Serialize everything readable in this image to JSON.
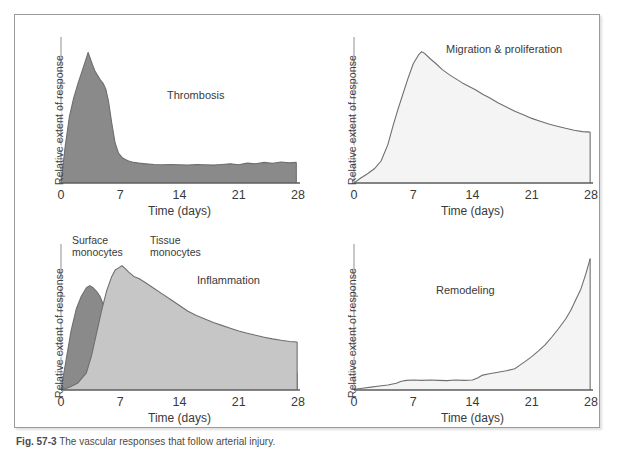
{
  "figure": {
    "caption_number": "Fig. 57-3",
    "caption_text": "The vascular responses that follow arterial injury.",
    "frame_color": "#9a9a9a",
    "background": "#ffffff"
  },
  "colors": {
    "dark_fill": "#8a8a8a",
    "mid_fill": "#c6c6c6",
    "light_fill": "#f4f4f4",
    "stroke": "#6f6f6f",
    "axis": "#9a9a9a",
    "text": "#3a3a3a"
  },
  "axes": {
    "xlabel": "Time (days)",
    "ylabel": "Relative extent of response",
    "xticks": [
      "0",
      "7",
      "14",
      "21",
      "28"
    ],
    "xlim": [
      0,
      28
    ],
    "ylim": [
      0,
      1
    ]
  },
  "chart_data": [
    {
      "type": "area",
      "title": "Thrombosis",
      "panel": "top-left",
      "xlabel": "Time (days)",
      "ylabel": "Relative extent of response",
      "xticks": [
        0,
        7,
        14,
        21,
        28
      ],
      "xlim": [
        0,
        28
      ],
      "ylim": [
        0,
        1
      ],
      "grid": false,
      "legend": "none",
      "series": [
        {
          "name": "Thrombosis",
          "fill": "#8a8a8a",
          "x": [
            0,
            0.5,
            1,
            1.5,
            2,
            2.5,
            3,
            3.2,
            3.5,
            3.8,
            4,
            4.3,
            4.6,
            5,
            5.3,
            5.6,
            6,
            6.4,
            6.8,
            7.2,
            7.6,
            8,
            8.6,
            9.2,
            10,
            11,
            12,
            13,
            14,
            15,
            16,
            17,
            18,
            19,
            20,
            21,
            22,
            23,
            24,
            25,
            26,
            27,
            27.8
          ],
          "values": [
            0.0,
            0.26,
            0.47,
            0.6,
            0.7,
            0.79,
            0.88,
            0.92,
            0.87,
            0.82,
            0.79,
            0.76,
            0.73,
            0.7,
            0.66,
            0.58,
            0.42,
            0.28,
            0.21,
            0.18,
            0.165,
            0.155,
            0.145,
            0.14,
            0.135,
            0.13,
            0.128,
            0.13,
            0.128,
            0.127,
            0.13,
            0.128,
            0.126,
            0.13,
            0.135,
            0.128,
            0.14,
            0.135,
            0.145,
            0.138,
            0.148,
            0.142,
            0.145
          ]
        }
      ]
    },
    {
      "type": "area",
      "title": "Migration & proliferation",
      "panel": "top-right",
      "xlabel": "Time (days)",
      "ylabel": "Relative extent of response",
      "xticks": [
        0,
        7,
        14,
        21,
        28
      ],
      "xlim": [
        0,
        28
      ],
      "ylim": [
        0,
        1
      ],
      "grid": false,
      "legend": "none",
      "series": [
        {
          "name": "Migration & proliferation",
          "fill": "#f4f4f4",
          "x": [
            0,
            0.8,
            1.6,
            2.4,
            3.2,
            4,
            4.6,
            5.2,
            5.8,
            6.4,
            7,
            7.6,
            8,
            8.4,
            9,
            9.6,
            10.4,
            11.2,
            12,
            12.8,
            13.6,
            14.4,
            15.2,
            16,
            17,
            18,
            19,
            20,
            21,
            22,
            23,
            24,
            25,
            26,
            27,
            27.9
          ],
          "values": [
            0.0,
            0.035,
            0.065,
            0.1,
            0.155,
            0.27,
            0.4,
            0.52,
            0.63,
            0.74,
            0.84,
            0.9,
            0.925,
            0.91,
            0.875,
            0.845,
            0.8,
            0.765,
            0.735,
            0.705,
            0.68,
            0.655,
            0.625,
            0.6,
            0.565,
            0.535,
            0.505,
            0.48,
            0.455,
            0.435,
            0.415,
            0.4,
            0.385,
            0.372,
            0.362,
            0.358
          ]
        }
      ]
    },
    {
      "type": "area",
      "title": "Inflammation",
      "panel": "bottom-left",
      "xlabel": "Time (days)",
      "ylabel": "Relative extent of response",
      "xticks": [
        0,
        7,
        14,
        21,
        28
      ],
      "xlim": [
        0,
        28
      ],
      "ylim": [
        0,
        1
      ],
      "grid": false,
      "legend": "inline-annotations",
      "series": [
        {
          "name": "Surface monocytes",
          "fill": "#8a8a8a",
          "x": [
            0,
            0.6,
            1.2,
            1.8,
            2.4,
            3,
            3.4,
            3.8,
            4.2,
            4.6,
            5,
            5.4,
            5.8,
            6.2,
            6.6,
            7,
            7.6,
            8.2,
            9,
            10,
            11,
            12,
            13,
            14,
            16,
            18,
            20,
            22,
            24,
            26,
            27.9
          ],
          "values": [
            0.0,
            0.21,
            0.42,
            0.57,
            0.66,
            0.72,
            0.735,
            0.72,
            0.695,
            0.66,
            0.6,
            0.5,
            0.38,
            0.27,
            0.2,
            0.165,
            0.145,
            0.135,
            0.128,
            0.125,
            0.124,
            0.123,
            0.123,
            0.122,
            0.122,
            0.122,
            0.122,
            0.122,
            0.122,
            0.122,
            0.122
          ]
        },
        {
          "name": "Tissue monocytes",
          "fill": "#c6c6c6",
          "x": [
            0,
            1,
            2,
            3,
            3.6,
            4.2,
            4.8,
            5.4,
            6,
            6.4,
            6.8,
            7.2,
            7.6,
            8,
            8.6,
            9.2,
            10,
            11,
            12,
            13,
            14,
            15,
            16,
            17,
            18,
            19,
            20,
            21,
            22,
            23,
            24,
            25,
            26,
            27,
            27.9
          ],
          "values": [
            0.0,
            0.02,
            0.05,
            0.12,
            0.24,
            0.4,
            0.56,
            0.7,
            0.8,
            0.845,
            0.86,
            0.875,
            0.855,
            0.83,
            0.8,
            0.785,
            0.755,
            0.715,
            0.675,
            0.635,
            0.595,
            0.555,
            0.525,
            0.5,
            0.475,
            0.455,
            0.435,
            0.415,
            0.4,
            0.385,
            0.372,
            0.36,
            0.35,
            0.342,
            0.338
          ]
        }
      ],
      "annotations": [
        {
          "text": "Surface\nmonocytes",
          "x": 1.0,
          "y": 1.02
        },
        {
          "text": "Tissue\nmonocytes",
          "x": 8.5,
          "y": 1.02
        }
      ]
    },
    {
      "type": "area",
      "title": "Remodeling",
      "panel": "bottom-right",
      "xlabel": "Time (days)",
      "ylabel": "Relative extent of response",
      "xticks": [
        0,
        7,
        14,
        21,
        28
      ],
      "xlim": [
        0,
        28
      ],
      "ylim": [
        0,
        1
      ],
      "grid": false,
      "legend": "none",
      "series": [
        {
          "name": "Remodeling",
          "fill": "#f4f4f4",
          "x": [
            0,
            1,
            2,
            3,
            4,
            5,
            5.6,
            6.2,
            7,
            8,
            9,
            10,
            11,
            12,
            13,
            14,
            14.6,
            15.2,
            16,
            17,
            18,
            19,
            19.6,
            20.2,
            21,
            21.8,
            22.6,
            23.4,
            24.2,
            25,
            25.6,
            26.2,
            26.8,
            27.4,
            27.9
          ],
          "values": [
            0.005,
            0.012,
            0.02,
            0.028,
            0.035,
            0.048,
            0.062,
            0.068,
            0.07,
            0.068,
            0.07,
            0.068,
            0.066,
            0.07,
            0.068,
            0.07,
            0.085,
            0.105,
            0.115,
            0.125,
            0.135,
            0.15,
            0.175,
            0.2,
            0.235,
            0.275,
            0.32,
            0.375,
            0.435,
            0.5,
            0.56,
            0.635,
            0.71,
            0.82,
            0.925
          ]
        }
      ]
    }
  ]
}
